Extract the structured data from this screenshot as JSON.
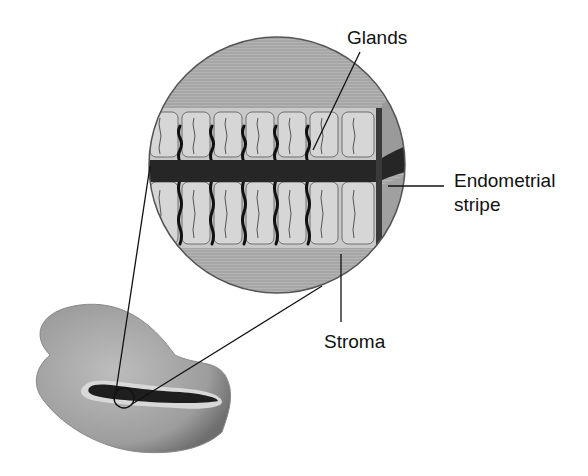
{
  "diagram": {
    "type": "anatomical-illustration",
    "labels": {
      "glands": "Glands",
      "endometrial_stripe_line1": "Endometrial",
      "endometrial_stripe_line2": "stripe",
      "stroma": "Stroma"
    },
    "colors": {
      "tissue": "#a9a9a9",
      "tissue_light": "#c8c8c8",
      "stripe": "#2a2a2a",
      "line": "#111111"
    }
  }
}
